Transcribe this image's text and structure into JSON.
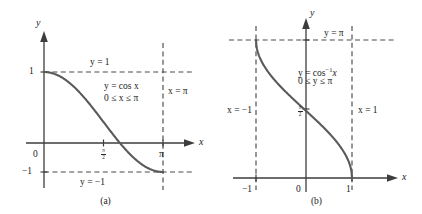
{
  "figure": {
    "panels": [
      {
        "id": "a",
        "caption": "(a)",
        "axis_x_name": "x",
        "axis_y_name": "y",
        "equation_line1": "y = cos x",
        "equation_line2": "0 ≤ x ≤ π",
        "asymptote_top": "y = 1",
        "asymptote_bottom": "y = −1",
        "boundary_right": "x = π",
        "ticks": {
          "y_top": "1",
          "y_bottom": "−1",
          "origin": "0",
          "x_right": "π",
          "x_mid_num": "π",
          "x_mid_den": "2"
        }
      },
      {
        "id": "b",
        "caption": "(b)",
        "axis_x_name": "x",
        "axis_y_name": "y",
        "equation_line1_pre": "y = cos",
        "equation_line1_sup": "−1",
        "equation_line1_post": "x",
        "equation_line2": "0 ≤ y ≤ π",
        "asymptote_top": "y = π",
        "boundary_left": "x = −1",
        "boundary_right": "x = 1",
        "ticks": {
          "x_left": "−1",
          "origin": "0",
          "x_right": "1",
          "y_mid_num": "π",
          "y_mid_den": "2"
        }
      }
    ],
    "colors": {
      "axis": "#3d3d3d",
      "curve": "#5a5a5a",
      "dashed": "#4a4a4a",
      "text": "#1a1a1a",
      "background": "#ffffff"
    }
  },
  "chart_data": [
    {
      "type": "line",
      "title": "y = cos x, 0 ≤ x ≤ π",
      "xlabel": "x",
      "ylabel": "y",
      "xlim": [
        -0.35,
        3.85
      ],
      "ylim": [
        -1.65,
        1.55
      ],
      "grid": false,
      "legend": "none",
      "xticks": [
        "0",
        "π/2",
        "π"
      ],
      "yticks": [
        "−1",
        "1"
      ],
      "x": [
        0,
        0.3142,
        0.6283,
        0.9425,
        1.2566,
        1.5708,
        1.885,
        2.1991,
        2.5133,
        2.8274,
        3.1416
      ],
      "y": [
        1,
        0.9511,
        0.809,
        0.5878,
        0.309,
        0,
        -0.309,
        -0.5878,
        -0.809,
        -0.9511,
        -1
      ],
      "annotations": [
        "y = 1",
        "y = −1",
        "x = π",
        "y = cos x",
        "0 ≤ x ≤ π"
      ]
    },
    {
      "type": "line",
      "title": "y = cos⁻¹ x, 0 ≤ y ≤ π",
      "xlabel": "x",
      "ylabel": "y",
      "xlim": [
        -1.75,
        1.75
      ],
      "ylim": [
        -0.55,
        3.95
      ],
      "grid": false,
      "legend": "none",
      "xticks": [
        "−1",
        "0",
        "1"
      ],
      "yticks": [
        "π/2",
        "π"
      ],
      "x": [
        -1,
        -0.9511,
        -0.809,
        -0.5878,
        -0.309,
        0,
        0.309,
        0.5878,
        0.809,
        0.9511,
        1
      ],
      "y": [
        3.1416,
        2.8274,
        2.5133,
        2.1991,
        1.885,
        1.5708,
        1.2566,
        0.9425,
        0.6283,
        0.3142,
        0
      ],
      "annotations": [
        "y = π",
        "x = −1",
        "x = 1",
        "y = cos⁻¹ x",
        "0 ≤ y ≤ π"
      ]
    }
  ]
}
